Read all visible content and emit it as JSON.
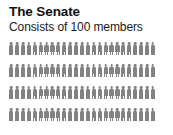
{
  "header": {
    "title": "The Senate",
    "subtitle": "Consists of 100 members"
  },
  "pictogram": {
    "icon_name": "person-icon",
    "icon_color": "#828282",
    "background_color": "#ffffff",
    "total_members": 100,
    "rows": 4,
    "icons_per_row": 25
  },
  "chart_data": {
    "type": "pictogram",
    "title": "The Senate",
    "subtitle": "Consists of 100 members",
    "unit_label": "member",
    "unit_value": 1,
    "categories": [
      "Senators"
    ],
    "values": [
      100
    ],
    "rows": [
      25,
      25,
      25,
      25
    ],
    "icon_color": "#828282",
    "legend": [],
    "xlabel": "",
    "ylabel": ""
  }
}
